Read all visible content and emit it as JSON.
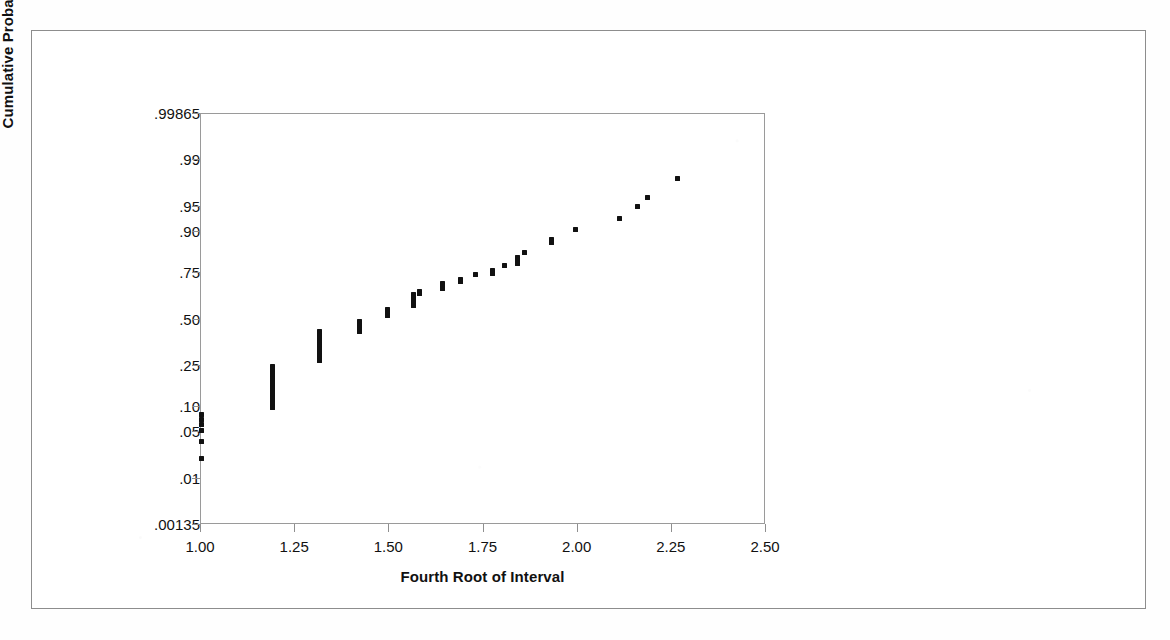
{
  "figure": {
    "background_color": "#ffffff",
    "marker_color": "#111111",
    "axis_color": "#8f8f8f",
    "border_color": "#8d8d8d"
  },
  "chart_data": {
    "type": "scatter",
    "title": "",
    "subtitle": "",
    "xlabel": "Fourth Root of Interval",
    "ylabel": "Cumulative Probability",
    "grid": false,
    "legend": "none",
    "xlim": [
      1.0,
      2.5
    ],
    "xticks": [
      1.0,
      1.25,
      1.5,
      1.75,
      2.0,
      2.25,
      2.5
    ],
    "xticklabels": [
      "1.00",
      "1.25",
      "1.50",
      "1.75",
      "2.00",
      "2.25",
      "2.50"
    ],
    "yscale": "normal-probability",
    "ylim": [
      0.00135,
      0.99865
    ],
    "yticks": [
      0.99865,
      0.99,
      0.95,
      0.9,
      0.75,
      0.5,
      0.25,
      0.1,
      0.05,
      0.01,
      0.00135
    ],
    "yticklabels": [
      ".99865",
      ".99",
      ".95",
      ".90",
      ".75",
      ".50",
      ".25",
      ".10",
      ".05",
      ".01",
      ".00135"
    ],
    "points": [
      {
        "x": 1.0,
        "y": 0.082
      },
      {
        "x": 1.0,
        "y": 0.072
      },
      {
        "x": 1.0,
        "y": 0.062
      },
      {
        "x": 1.0,
        "y": 0.052
      },
      {
        "x": 1.0,
        "y": 0.038
      },
      {
        "x": 1.0,
        "y": 0.021
      },
      {
        "x": 1.19,
        "y": 0.245
      },
      {
        "x": 1.19,
        "y": 0.235
      },
      {
        "x": 1.19,
        "y": 0.225
      },
      {
        "x": 1.19,
        "y": 0.215
      },
      {
        "x": 1.19,
        "y": 0.205
      },
      {
        "x": 1.19,
        "y": 0.195
      },
      {
        "x": 1.19,
        "y": 0.186
      },
      {
        "x": 1.19,
        "y": 0.177
      },
      {
        "x": 1.19,
        "y": 0.168
      },
      {
        "x": 1.19,
        "y": 0.159
      },
      {
        "x": 1.19,
        "y": 0.15
      },
      {
        "x": 1.19,
        "y": 0.142
      },
      {
        "x": 1.19,
        "y": 0.134
      },
      {
        "x": 1.19,
        "y": 0.126
      },
      {
        "x": 1.19,
        "y": 0.118
      },
      {
        "x": 1.19,
        "y": 0.11
      },
      {
        "x": 1.19,
        "y": 0.1
      },
      {
        "x": 1.315,
        "y": 0.43
      },
      {
        "x": 1.315,
        "y": 0.418
      },
      {
        "x": 1.315,
        "y": 0.406
      },
      {
        "x": 1.315,
        "y": 0.394
      },
      {
        "x": 1.315,
        "y": 0.382
      },
      {
        "x": 1.315,
        "y": 0.37
      },
      {
        "x": 1.315,
        "y": 0.358
      },
      {
        "x": 1.315,
        "y": 0.346
      },
      {
        "x": 1.315,
        "y": 0.334
      },
      {
        "x": 1.315,
        "y": 0.322
      },
      {
        "x": 1.315,
        "y": 0.31
      },
      {
        "x": 1.315,
        "y": 0.298
      },
      {
        "x": 1.315,
        "y": 0.286
      },
      {
        "x": 1.315,
        "y": 0.274
      },
      {
        "x": 1.42,
        "y": 0.49
      },
      {
        "x": 1.42,
        "y": 0.478
      },
      {
        "x": 1.42,
        "y": 0.466
      },
      {
        "x": 1.42,
        "y": 0.454
      },
      {
        "x": 1.42,
        "y": 0.442
      },
      {
        "x": 1.42,
        "y": 0.43
      },
      {
        "x": 1.495,
        "y": 0.56
      },
      {
        "x": 1.495,
        "y": 0.548
      },
      {
        "x": 1.495,
        "y": 0.536
      },
      {
        "x": 1.495,
        "y": 0.524
      },
      {
        "x": 1.565,
        "y": 0.64
      },
      {
        "x": 1.565,
        "y": 0.628
      },
      {
        "x": 1.565,
        "y": 0.616
      },
      {
        "x": 1.565,
        "y": 0.604
      },
      {
        "x": 1.565,
        "y": 0.592
      },
      {
        "x": 1.565,
        "y": 0.58
      },
      {
        "x": 1.58,
        "y": 0.66
      },
      {
        "x": 1.58,
        "y": 0.648
      },
      {
        "x": 1.64,
        "y": 0.7
      },
      {
        "x": 1.64,
        "y": 0.688
      },
      {
        "x": 1.64,
        "y": 0.676
      },
      {
        "x": 1.69,
        "y": 0.72
      },
      {
        "x": 1.69,
        "y": 0.708
      },
      {
        "x": 1.73,
        "y": 0.745
      },
      {
        "x": 1.775,
        "y": 0.762
      },
      {
        "x": 1.775,
        "y": 0.75
      },
      {
        "x": 1.805,
        "y": 0.785
      },
      {
        "x": 1.84,
        "y": 0.818
      },
      {
        "x": 1.84,
        "y": 0.806
      },
      {
        "x": 1.84,
        "y": 0.794
      },
      {
        "x": 1.86,
        "y": 0.836
      },
      {
        "x": 1.93,
        "y": 0.88
      },
      {
        "x": 1.93,
        "y": 0.868
      },
      {
        "x": 1.995,
        "y": 0.905
      },
      {
        "x": 2.11,
        "y": 0.93
      },
      {
        "x": 2.16,
        "y": 0.95
      },
      {
        "x": 2.185,
        "y": 0.963
      },
      {
        "x": 2.265,
        "y": 0.98
      }
    ]
  }
}
